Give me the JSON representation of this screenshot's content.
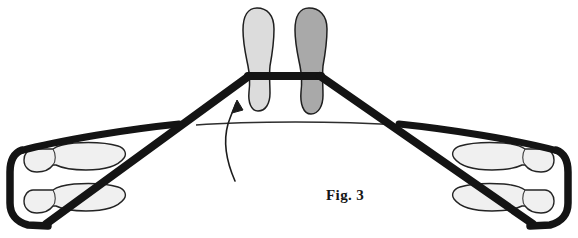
{
  "figure": {
    "caption": "Fig. 3",
    "title_text": "Fig. 3",
    "background_color": "#ffffff",
    "stroke_color": "#1a1a1a",
    "thin_line_color": "#2b2b2b",
    "arrow_color": "#202020",
    "elements": [
      {
        "name": "center-crossbar",
        "kind": "thick-black-bar",
        "orientation": "horizontal",
        "x_start": 248,
        "x_end": 321,
        "y": 75
      },
      {
        "name": "left-diagonal-strut",
        "kind": "thick-black-line",
        "from": [
          248,
          75
        ],
        "to": [
          45,
          224
        ]
      },
      {
        "name": "right-diagonal-strut",
        "kind": "thick-black-line",
        "from": [
          321,
          75
        ],
        "to": [
          534,
          224
        ]
      },
      {
        "name": "left-upper-rail",
        "kind": "thick-curved-line",
        "from": [
          178,
          124
        ],
        "to": [
          16,
          152
        ]
      },
      {
        "name": "right-upper-rail",
        "kind": "thick-curved-line",
        "from": [
          400,
          124
        ],
        "to": [
          562,
          152
        ]
      },
      {
        "name": "left-end-bracket",
        "kind": "thick-rounded-bracket",
        "x": 16,
        "y_top": 146,
        "y_bottom": 224
      },
      {
        "name": "right-end-bracket",
        "kind": "thick-rounded-bracket",
        "x": 562,
        "y_top": 146,
        "y_bottom": 224
      },
      {
        "name": "center-thin-axle-line",
        "kind": "thin-horizontal-line",
        "x_start": 196,
        "x_end": 397,
        "y": 124
      },
      {
        "name": "rotation-arrow",
        "kind": "curved-arrow",
        "tail": [
          235,
          180
        ],
        "head": [
          237,
          101
        ],
        "direction": "up-left"
      }
    ],
    "shoes": [
      {
        "name": "center-left-sole",
        "position": "center-left",
        "fill": "#dcdcdc",
        "shade": "light-gray",
        "orientation": "vertical"
      },
      {
        "name": "center-right-sole",
        "position": "center-right",
        "fill": "#a8a8a8",
        "shade": "dark-gray",
        "orientation": "vertical"
      },
      {
        "name": "left-upper-sole",
        "position": "left-upper",
        "fill": "#eeeeee",
        "shade": "outline-light",
        "orientation": "horizontal-toe-right"
      },
      {
        "name": "left-lower-sole",
        "position": "left-lower",
        "fill": "#eeeeee",
        "shade": "outline-light",
        "orientation": "horizontal-toe-right"
      },
      {
        "name": "right-upper-sole",
        "position": "right-upper",
        "fill": "#eeeeee",
        "shade": "outline-light",
        "orientation": "horizontal-toe-left"
      },
      {
        "name": "right-lower-sole",
        "position": "right-lower",
        "fill": "#eeeeee",
        "shade": "outline-light",
        "orientation": "horizontal-toe-left"
      }
    ]
  }
}
